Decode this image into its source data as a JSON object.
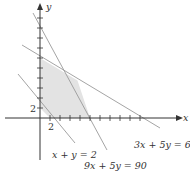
{
  "diagram": {
    "type": "linear-programming-feasible-region",
    "axes": {
      "x_label": "x",
      "y_label": "y",
      "origin_label_x": "2",
      "origin_label_y": "2",
      "tick_step": 2
    },
    "constraints": [
      {
        "label": "x + y = 2",
        "a": 1,
        "b": 1,
        "c": 2
      },
      {
        "label": "9x + 5y = 90",
        "a": 9,
        "b": 5,
        "c": 90
      },
      {
        "label": "3x + 5y = 60",
        "a": 3,
        "b": 5,
        "c": 60
      }
    ],
    "feasible_region": {
      "vertices": [
        [
          0,
          2
        ],
        [
          0,
          12
        ],
        [
          7.5,
          7.5
        ],
        [
          10,
          0
        ],
        [
          2,
          0
        ]
      ],
      "fill": "#e3e3e3"
    },
    "colors": {
      "axis": "#333333",
      "line": "#9a9a9a",
      "region": "#e3e3e3"
    }
  }
}
